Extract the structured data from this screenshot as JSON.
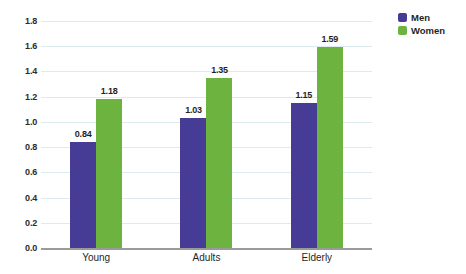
{
  "chart_data": {
    "type": "bar",
    "title": "",
    "subtitle": "",
    "xlabel": "",
    "ylabel": "",
    "categories": [
      "Young",
      "Adults",
      "Elderly"
    ],
    "series": [
      {
        "name": "Men",
        "color": "#473C95",
        "values": [
          0.84,
          1.03,
          1.15
        ],
        "labels": [
          "0.84",
          "1.03",
          "1.15"
        ]
      },
      {
        "name": "Women",
        "color": "#6CB33F",
        "values": [
          1.18,
          1.35,
          1.59
        ],
        "labels": [
          "1.18",
          "1.35",
          "1.59"
        ]
      }
    ],
    "ylim": [
      0.0,
      1.8
    ],
    "ytick_values": [
      0.0,
      0.2,
      0.4,
      0.6,
      0.8,
      1.0,
      1.2,
      1.4,
      1.6,
      1.8
    ],
    "ytick_labels": [
      "0.0",
      "0.2",
      "0.4",
      "0.6",
      "0.8",
      "1.0",
      "1.2",
      "1.4",
      "1.6",
      "1.8"
    ],
    "grid": true,
    "grid_axis": "y",
    "grid_color": "#dceaf2",
    "axis_line_color": "#9a9a9a",
    "background": "#ffffff",
    "legend_position": "top-right",
    "data_labels_shown": true,
    "bar_group_gap": true,
    "bars_adjacent_within_group": true
  },
  "legend": {
    "items": [
      {
        "label": "Men",
        "swatch": "men-swatch"
      },
      {
        "label": "Women",
        "swatch": "women-swatch"
      }
    ]
  }
}
